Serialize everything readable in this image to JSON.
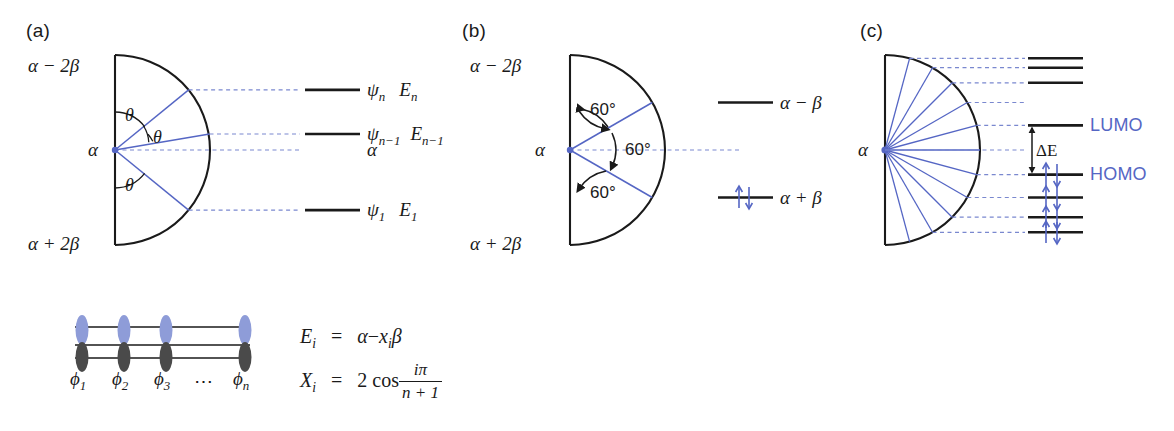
{
  "figure": {
    "colors": {
      "ink": "#1a1a1a",
      "blue": "#5566c4",
      "blue_dash": "#7a88cf",
      "lobe_top": "#8e9cd8",
      "lobe_bottom": "#4a4a4a"
    }
  },
  "panels": {
    "a": {
      "label": "(a)",
      "top_axis": "α − 2β",
      "mid_axis": "α",
      "bottom_axis": "α + 2β",
      "angle_labels": [
        "θ",
        "θ",
        "θ"
      ],
      "levels": [
        {
          "orbital": "ψ",
          "orbital_sub": "n",
          "energy": "E",
          "energy_sub": "n"
        },
        {
          "orbital": "ψ",
          "orbital_sub": "n−1",
          "energy": "E",
          "energy_sub": "n−1"
        },
        {
          "orbital": "α",
          "orbital_sub": "",
          "energy": "",
          "energy_sub": ""
        },
        {
          "orbital": "ψ",
          "orbital_sub": "1",
          "energy": "E",
          "energy_sub": "1"
        }
      ],
      "chain": {
        "basis_labels": [
          "ϕ",
          "ϕ",
          "ϕ",
          "ϕ"
        ],
        "basis_subs": [
          "1",
          "2",
          "3",
          "n"
        ],
        "ellipsis": "⋯"
      },
      "equations": {
        "energy_lhs": "E",
        "energy_lhs_sub": "i",
        "energy_rhs_a": "α",
        "energy_rhs_minus": "−",
        "energy_rhs_x": "x",
        "energy_rhs_x_sub": "i",
        "energy_rhs_beta": "β",
        "coef_lhs": "X",
        "coef_lhs_sub": "i",
        "coef_fn": "2 cos",
        "coef_num": "iπ",
        "coef_den": "n + 1"
      }
    },
    "b": {
      "label": "(b)",
      "top_axis": "α − 2β",
      "mid_axis": "α",
      "bottom_axis": "α + 2β",
      "angle_labels": [
        "60°",
        "60°",
        "60°"
      ],
      "levels": [
        {
          "label": "α − β",
          "occupancy": "empty"
        },
        {
          "label": "α + β",
          "occupancy": "paired"
        }
      ]
    },
    "c": {
      "label": "(c)",
      "mid_axis": "α",
      "gap_label": "ΔE",
      "lumo_label": "LUMO",
      "homo_label": "HOMO",
      "levels": [
        {
          "name": "level-7",
          "occupancy": "empty"
        },
        {
          "name": "level-6",
          "occupancy": "empty"
        },
        {
          "name": "level-5",
          "occupancy": "empty"
        },
        {
          "name": "lumo",
          "occupancy": "empty"
        },
        {
          "name": "homo",
          "occupancy": "paired"
        },
        {
          "name": "level-3",
          "occupancy": "paired"
        },
        {
          "name": "level-2",
          "occupancy": "paired"
        },
        {
          "name": "level-1",
          "occupancy": "paired"
        }
      ]
    }
  }
}
